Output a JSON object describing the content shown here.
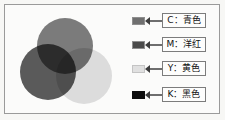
{
  "figure": {
    "background_color": "#f7f7f5",
    "frame_color": "#9a9a9a"
  },
  "venn": {
    "name": "cmy-venn-diagram",
    "circles": [
      {
        "key": "C",
        "label": "C",
        "color": "#7b7b7b",
        "cx": 55,
        "cy": 36,
        "r": 28
      },
      {
        "key": "M",
        "label": "M",
        "color": "#4f4f4f",
        "cx": 38,
        "cy": 62,
        "r": 28
      },
      {
        "key": "Y",
        "label": "Y",
        "color": "#d9d9d9",
        "cx": 74,
        "cy": 66,
        "r": 28
      }
    ],
    "overlap_center_color": "#101010"
  },
  "legend": {
    "name": "cmyk-legend",
    "items": [
      {
        "key": "C",
        "swatch_color": "#6f6f6f",
        "label": "C：青色"
      },
      {
        "key": "M",
        "swatch_color": "#4a4a4a",
        "label": "M：洋红"
      },
      {
        "key": "Y",
        "swatch_color": "#e0e0e0",
        "label": "Y：黄色"
      },
      {
        "key": "K",
        "swatch_color": "#0d0d0d",
        "label": "K：黑色"
      }
    ]
  }
}
